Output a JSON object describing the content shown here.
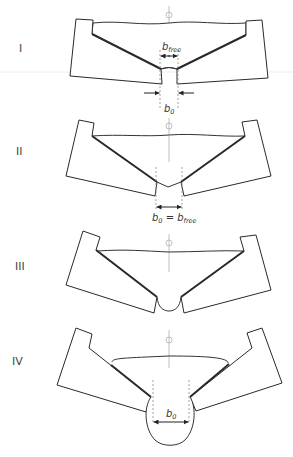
{
  "stages": [
    {
      "id": "I",
      "label": "I",
      "annotations": {
        "top": "b",
        "top_sub": "free",
        "bottom": "b",
        "bottom_sub": "0"
      }
    },
    {
      "id": "II",
      "label": "II",
      "annotations": {
        "eq_b": "b",
        "eq_b_sub": "0",
        "eq_sign": " = ",
        "eq_b2": "b",
        "eq_b2_sub": "free"
      }
    },
    {
      "id": "III",
      "label": "III",
      "annotations": {}
    },
    {
      "id": "IV",
      "label": "IV",
      "annotations": {
        "width": "b",
        "width_sub": "0"
      }
    }
  ],
  "symbols": {
    "centerline": "phi-centerline-symbol"
  },
  "colors": {
    "outline": "#2a2a2a",
    "centerline": "#b0b0b0",
    "dashed": "#8a8a8a"
  }
}
